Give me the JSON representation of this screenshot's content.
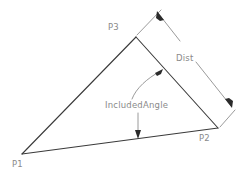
{
  "diagram": {
    "background_color": "#ffffff",
    "edge_color": "#3a3a3a",
    "annotation_color": "#8f8f8f",
    "text_color": "#8a8a8a",
    "vertices": [
      {
        "id": "P1",
        "label": "P1",
        "x": 22,
        "y": 154
      },
      {
        "id": "P2",
        "label": "P2",
        "x": 218,
        "y": 128
      },
      {
        "id": "P3",
        "label": "P3",
        "x": 136,
        "y": 37
      }
    ],
    "edges": [
      {
        "from": "P1",
        "to": "P3"
      },
      {
        "from": "P3",
        "to": "P2"
      },
      {
        "from": "P2",
        "to": "P1"
      }
    ],
    "dimensions": [
      {
        "id": "dist",
        "label": "Dist",
        "measures": "P3-P2",
        "arrowheads": "both",
        "start": {
          "x": 158,
          "y": 13
        },
        "end": {
          "x": 231,
          "y": 106
        }
      }
    ],
    "annotations": [
      {
        "id": "included-angle",
        "label": "IncludedAngle",
        "leaders": 2,
        "points_to": [
          "P3-P2 edge",
          "P1-P2 edge"
        ]
      }
    ]
  },
  "labels": {
    "p1": "P1",
    "p2": "P2",
    "p3": "P3",
    "dist": "Dist",
    "included_angle": "IncludedAngle"
  }
}
